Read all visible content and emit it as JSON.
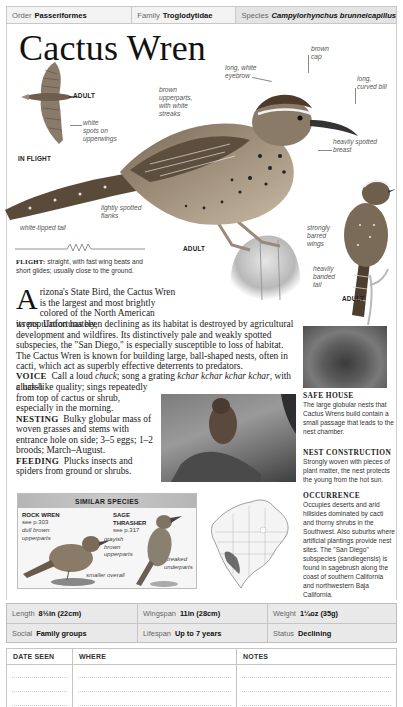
{
  "taxonomy": {
    "order_label": "Order",
    "order_value": "Passeriformes",
    "family_label": "Family",
    "family_value": "Troglodytidae",
    "species_label": "Species",
    "species_value": "Campylorhynchus brunneicapillus"
  },
  "title": "Cactus Wren",
  "illustration": {
    "flight_labels": {
      "adult": "ADULT",
      "in_flight": "IN FLIGHT",
      "white_spots": [
        "white",
        "spots on",
        "upperwings"
      ]
    },
    "main_annotations": {
      "brown_upperparts": [
        "brown",
        "upperparts,",
        "with white",
        "streaks"
      ],
      "long_white_eyebrow": [
        "long, white",
        "eyebrow"
      ],
      "brown_cap": [
        "brown",
        "cap"
      ],
      "long_curved_bill": [
        "long,",
        "curved bill"
      ],
      "heavily_spotted_breast": [
        "heavily spotted",
        "breast"
      ],
      "lightly_spotted_flanks": [
        "lightly spotted",
        "flanks"
      ],
      "white_tipped_tail": "white-tipped tail",
      "adult": "ADULT"
    },
    "side_annotations": {
      "strongly_barred_wings": [
        "strongly",
        "barred",
        "wings"
      ],
      "heavily_banded_tail": [
        "heavily",
        "banded",
        "tail"
      ],
      "adult": "ADULT"
    }
  },
  "flight": {
    "label": "FLIGHT:",
    "text": "straight, with fast wing beats and short glides; usually close to the ground."
  },
  "description": {
    "drop_cap": "A",
    "intro_first": "rizona's State Bird, the Cactus Wren is the largest and most brightly colored of the North American wrens. Unfortunately,",
    "intro_rest": "its population has been declining as its habitat is destroyed by agricultural development and wildfires. Its distinctively pale and weakly spotted subspecies, the \"San Diego,\" is especially susceptible to loss of habitat. The Cactus Wren is known for building large, ball-shaped nests, often in cacti, which act as superbly effective deterrents to predators.",
    "voice_label": "VOICE",
    "voice_pre": "Call a loud ",
    "voice_call": "chuck",
    "voice_mid": "; song a grating ",
    "voice_song": "kchar kchar kchar kchar",
    "voice_post": ", with a harsh",
    "voice_cont": "cluck-like quality; sings repeatedly from top of cactus or shrub, especially in the morning.",
    "nesting_label": "NESTING",
    "nesting_text": "Bulky globular mass of woven grasses and stems with entrance hole on side; 3–5 eggs; 1–2 broods; March–August.",
    "feeding_label": "FEEDING",
    "feeding_text": "Plucks insects and spiders from ground or shrubs."
  },
  "sidebar": {
    "safe_house": {
      "heading": "SAFE HOUSE",
      "text": "The large globular nests that Cactus Wrens build contain a small passage that leads to the nest chamber."
    },
    "nest_construction": {
      "heading": "NEST CONSTRUCTION",
      "text": "Strongly woven with pieces of plant matter, the nest protects the young from the hot sun."
    },
    "occurrence": {
      "heading": "OCCURRENCE",
      "text": "Occupies deserts and arid hillsides dominated by cacti and thorny shrubs in the Southwest. Also suburbs where artificial plantings provide nest sites. The \"San Diego\" subspecies (sandiegensis) is found in sagebrush along the coast of southern California and northwestern Baja California."
    }
  },
  "similar_species": {
    "heading": "SIMILAR SPECIES",
    "species": [
      {
        "name": "ROCK WREN",
        "see": "see p.303",
        "notes": [
          [
            "dull brown",
            "upperparts"
          ],
          [
            "smaller overall"
          ]
        ]
      },
      {
        "name": [
          "SAGE",
          "THRASHER"
        ],
        "see": "see p.317",
        "notes": [
          [
            "grayish",
            "brown",
            "upperparts"
          ],
          [
            "streaked",
            "underparts"
          ]
        ]
      }
    ]
  },
  "stats": {
    "length_label": "Length",
    "length_value": "8½in (22cm)",
    "wingspan_label": "Wingspan",
    "wingspan_value": "11in (28cm)",
    "weight_label": "Weight",
    "weight_value": "1¼oz (35g)",
    "social_label": "Social",
    "social_value": "Family groups",
    "lifespan_label": "Lifespan",
    "lifespan_value": "Up to 7 years",
    "status_label": "Status",
    "status_value": "Declining"
  },
  "log": {
    "columns": [
      "DATE SEEN",
      "WHERE",
      "NOTES"
    ]
  }
}
